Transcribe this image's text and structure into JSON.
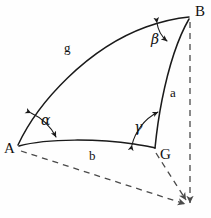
{
  "figure": {
    "background_color": "#fefefe",
    "line_color": "#1a1a1a",
    "dashed_color": "#4a4a4a"
  },
  "vertices": [
    {
      "name": "A",
      "label": "A",
      "x": 18,
      "y": 147
    },
    {
      "name": "B",
      "label": "B",
      "x": 190,
      "y": 18
    },
    {
      "name": "G",
      "label": "G",
      "x": 155,
      "y": 148
    }
  ],
  "sides": [
    {
      "name": "g",
      "label": "g",
      "from": "A",
      "to": "B",
      "style": "solid-arc"
    },
    {
      "name": "a",
      "label": "a",
      "from": "G",
      "to": "B",
      "style": "solid-arc"
    },
    {
      "name": "b",
      "label": "b",
      "from": "A",
      "to": "G",
      "style": "solid-arc"
    }
  ],
  "angles": [
    {
      "name": "alpha",
      "label": "α",
      "at_vertex": "A"
    },
    {
      "name": "beta",
      "label": "β",
      "at_vertex": "B"
    },
    {
      "name": "gamma",
      "label": "γ",
      "at_vertex": "G"
    }
  ],
  "construction_lines": [
    {
      "name": "vertical-axis-from-B",
      "style": "dashed",
      "from": "B",
      "to": "center-point"
    },
    {
      "name": "radius-from-A",
      "style": "dashed",
      "from": "A",
      "to": "center-point"
    },
    {
      "name": "radius-from-G",
      "style": "dashed",
      "from": "G",
      "to": "center-point"
    }
  ]
}
